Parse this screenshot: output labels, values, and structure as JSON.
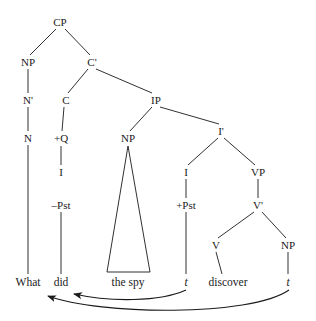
{
  "figure": {
    "type": "syntax-tree",
    "sentence": "What did the spy discover",
    "background_color": "#ffffff",
    "line_color": "#1a1a1a",
    "width": 316,
    "height": 321
  },
  "nodes": [
    {
      "id": "cp",
      "label": "CP",
      "x": 60,
      "y": 22,
      "style": "plain"
    },
    {
      "id": "np-spec",
      "label": "NP",
      "x": 28,
      "y": 62,
      "style": "plain"
    },
    {
      "id": "cbar",
      "label": "C'",
      "x": 92,
      "y": 62,
      "style": "plain"
    },
    {
      "id": "nbar",
      "label": "N'",
      "x": 28,
      "y": 100,
      "style": "plain"
    },
    {
      "id": "c-head",
      "label": "C",
      "x": 66,
      "y": 100,
      "style": "plain"
    },
    {
      "id": "ip",
      "label": "IP",
      "x": 156,
      "y": 100,
      "style": "plain"
    },
    {
      "id": "n-head",
      "label": "N",
      "x": 28,
      "y": 138,
      "style": "plain"
    },
    {
      "id": "plus-q",
      "label": "+Q",
      "x": 61,
      "y": 138,
      "style": "plain"
    },
    {
      "id": "np-subj",
      "label": "NP",
      "x": 128,
      "y": 138,
      "style": "plain"
    },
    {
      "id": "ibar",
      "label": "I'",
      "x": 221,
      "y": 131,
      "style": "plain"
    },
    {
      "id": "i-c",
      "label": "I",
      "x": 61,
      "y": 172,
      "style": "plain"
    },
    {
      "id": "i-head",
      "label": "I",
      "x": 186,
      "y": 172,
      "style": "plain"
    },
    {
      "id": "vp",
      "label": "VP",
      "x": 258,
      "y": 172,
      "style": "plain"
    },
    {
      "id": "minus-pst",
      "label": "–Pst",
      "x": 61,
      "y": 205,
      "style": "plain"
    },
    {
      "id": "plus-pst",
      "label": "+Pst",
      "x": 186,
      "y": 205,
      "style": "plain"
    },
    {
      "id": "vbar",
      "label": "V'",
      "x": 258,
      "y": 205,
      "style": "plain"
    },
    {
      "id": "v-head",
      "label": "V",
      "x": 216,
      "y": 245,
      "style": "plain"
    },
    {
      "id": "np-obj",
      "label": "NP",
      "x": 288,
      "y": 245,
      "style": "plain"
    }
  ],
  "terminals": [
    {
      "id": "what",
      "label": "What",
      "x": 28,
      "y": 282,
      "style": "plain"
    },
    {
      "id": "did",
      "label": "did",
      "x": 61,
      "y": 282,
      "style": "plain"
    },
    {
      "id": "the-spy",
      "label": "the spy",
      "x": 128,
      "y": 282,
      "style": "plain"
    },
    {
      "id": "trace-1",
      "label": "t",
      "x": 186,
      "y": 282,
      "style": "italic"
    },
    {
      "id": "discover",
      "label": "discover",
      "x": 228,
      "y": 282,
      "style": "plain"
    },
    {
      "id": "trace-2",
      "label": "t",
      "x": 288,
      "y": 282,
      "style": "italic"
    }
  ],
  "branches": [
    {
      "from": "cp",
      "to": "np-spec"
    },
    {
      "from": "cp",
      "to": "cbar"
    },
    {
      "from": "np-spec",
      "to": "nbar"
    },
    {
      "from": "cbar",
      "to": "c-head"
    },
    {
      "from": "cbar",
      "to": "ip"
    },
    {
      "from": "nbar",
      "to": "n-head"
    },
    {
      "from": "c-head",
      "to": "plus-q"
    },
    {
      "from": "ip",
      "to": "np-subj"
    },
    {
      "from": "ip",
      "to": "ibar"
    },
    {
      "from": "plus-q",
      "to": "i-c"
    },
    {
      "from": "ibar",
      "to": "i-head"
    },
    {
      "from": "ibar",
      "to": "vp"
    },
    {
      "from": "vp",
      "to": "vbar"
    },
    {
      "from": "vbar",
      "to": "v-head"
    },
    {
      "from": "vbar",
      "to": "np-obj"
    },
    {
      "from": "n-head",
      "to": "what"
    },
    {
      "from": "minus-pst",
      "to": "did"
    },
    {
      "from": "i-head",
      "to": "plus-pst"
    },
    {
      "from": "plus-pst",
      "to": "trace-1"
    },
    {
      "from": "v-head",
      "to": "discover"
    },
    {
      "from": "np-obj",
      "to": "trace-2"
    }
  ],
  "triangle": {
    "apex_x": 128,
    "apex_y": 145,
    "left_x": 107,
    "right_x": 150,
    "base_y": 272,
    "covers": "the spy"
  },
  "movement_arrows": [
    {
      "id": "head-movement",
      "from": "trace-1",
      "to": "did",
      "description": "I-to-C head movement of past tense auxiliary"
    },
    {
      "id": "wh-movement",
      "from": "trace-2",
      "to": "What",
      "description": "wh-phrase movement to specifier of CP"
    }
  ]
}
